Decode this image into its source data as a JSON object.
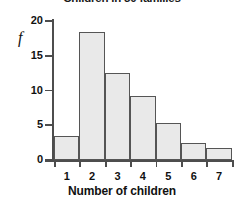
{
  "chart_data": {
    "type": "bar",
    "title": "Children in 50 families",
    "xlabel": "Number of children",
    "ylabel": "f",
    "categories": [
      "1",
      "2",
      "3",
      "4",
      "5",
      "6",
      "7"
    ],
    "values": [
      3.5,
      18.4,
      12.5,
      9.2,
      5.3,
      2.5,
      1.7
    ],
    "ylim": [
      0,
      20
    ],
    "yticks": [
      0,
      5,
      10,
      15,
      20
    ],
    "ytick_labels": [
      "0",
      "5",
      "10",
      "15",
      "20"
    ],
    "grid": false,
    "legend": null,
    "bar_fill_color": "#e9e9e9",
    "bar_border_color": "#555555",
    "axis_color": "#4d4d4d",
    "text_color": "#111111"
  }
}
